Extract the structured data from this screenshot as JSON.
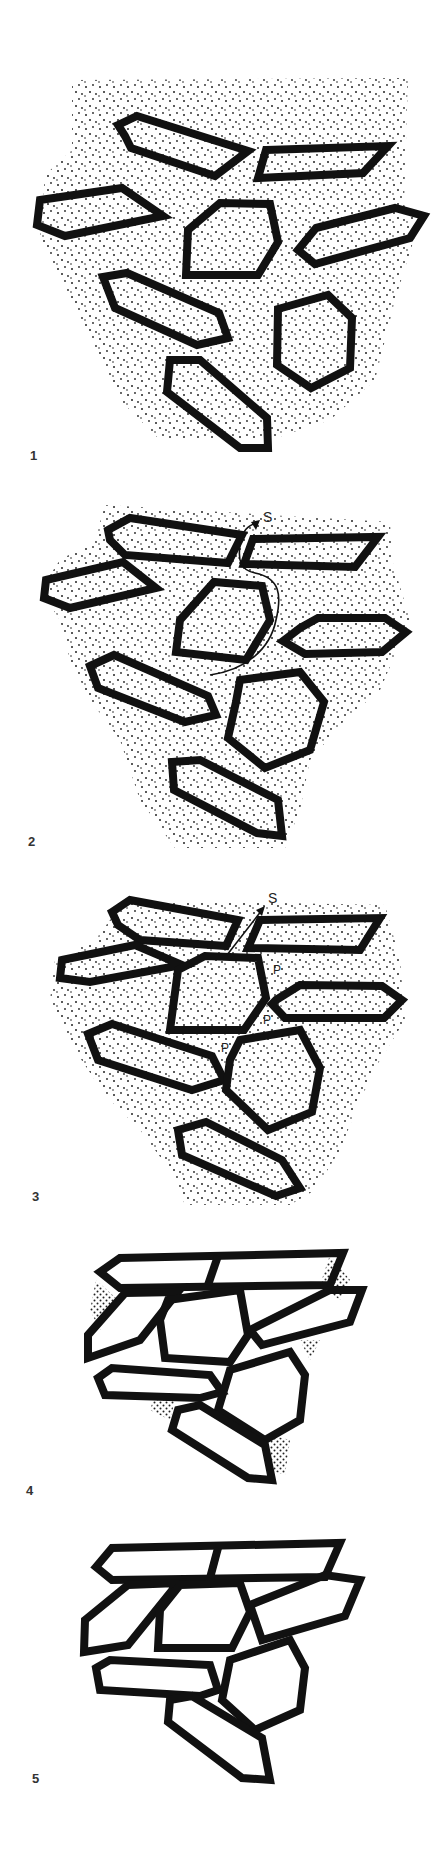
{
  "figure": {
    "panels": [
      {
        "id": 1,
        "label": "1",
        "stage": "loose grains in pore fluid"
      },
      {
        "id": 2,
        "label": "2",
        "stage": "grains settling, fluid escape path",
        "annotations": [
          "S"
        ]
      },
      {
        "id": 3,
        "label": "3",
        "stage": "grains contacting, pore spaces",
        "annotations": [
          "S",
          "P",
          "P",
          "P"
        ]
      },
      {
        "id": 4,
        "label": "4",
        "stage": "grains compacted, residual pore fluid"
      },
      {
        "id": 5,
        "label": "5",
        "stage": "fully compacted grain framework"
      }
    ],
    "annotations": {
      "escape_path_label": "S",
      "pore_label": "P"
    },
    "colors": {
      "outline": "#111111",
      "stipple": "#222222",
      "background": "#ffffff"
    }
  }
}
